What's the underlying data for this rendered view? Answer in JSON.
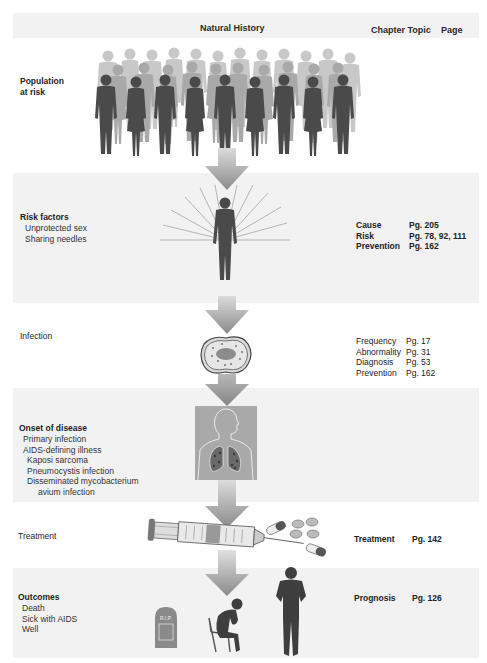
{
  "header": {
    "title": "Natural History",
    "col_topic": "Chapter Topic",
    "col_page": "Page"
  },
  "stages": [
    {
      "id": "population",
      "title_line1": "Population",
      "title_line2": "at risk",
      "details": [],
      "refs": [],
      "illustration": "crowd-of-people"
    },
    {
      "id": "risk-factors",
      "title": "Risk factors",
      "details": [
        "Unprotected sex",
        "Sharing needles"
      ],
      "refs": [
        {
          "topic": "Cause",
          "page": "Pg. 205"
        },
        {
          "topic": "Risk",
          "page": "Pg. 78, 92, 111"
        },
        {
          "topic": "Prevention",
          "page": "Pg. 162"
        }
      ],
      "illustration": "person-with-radiating-lines"
    },
    {
      "id": "infection",
      "title": "Infection",
      "details": [],
      "refs": [
        {
          "topic": "Frequency",
          "page": "Pg. 17"
        },
        {
          "topic": "Abnormality",
          "page": "Pg. 31"
        },
        {
          "topic": "Diagnosis",
          "page": "Pg. 53"
        },
        {
          "topic": "Prevention",
          "page": "Pg. 162"
        }
      ],
      "illustration": "infected-cell"
    },
    {
      "id": "onset",
      "title": "Onset of disease",
      "details": [
        "Primary infection",
        "AIDS-defining illness",
        "Kaposi sarcoma",
        "Pneumocystis infection",
        "Disseminated mycobacterium",
        "avium infection"
      ],
      "refs": [],
      "illustration": "lungs"
    },
    {
      "id": "treatment",
      "title": "Treatment",
      "details": [],
      "refs": [
        {
          "topic": "Treatment",
          "page": "Pg. 142"
        }
      ],
      "illustration": "syringe-and-pills"
    },
    {
      "id": "outcomes",
      "title": "Outcomes",
      "details": [
        "Death",
        "Sick with AIDS",
        "Well"
      ],
      "refs": [
        {
          "topic": "Prognosis",
          "page": "Pg. 126"
        }
      ],
      "illustration": "tombstone-sick-well",
      "tombstone_text": "R.I.P."
    }
  ],
  "colors": {
    "band": "#f2f2f2",
    "silhouette": "#4a4a4a",
    "silhouette_back": "#b8b8b8",
    "arrow_top": "#d8d8d8",
    "arrow_bottom": "#8c8c8c",
    "lung_box": "#a8a8a8"
  }
}
